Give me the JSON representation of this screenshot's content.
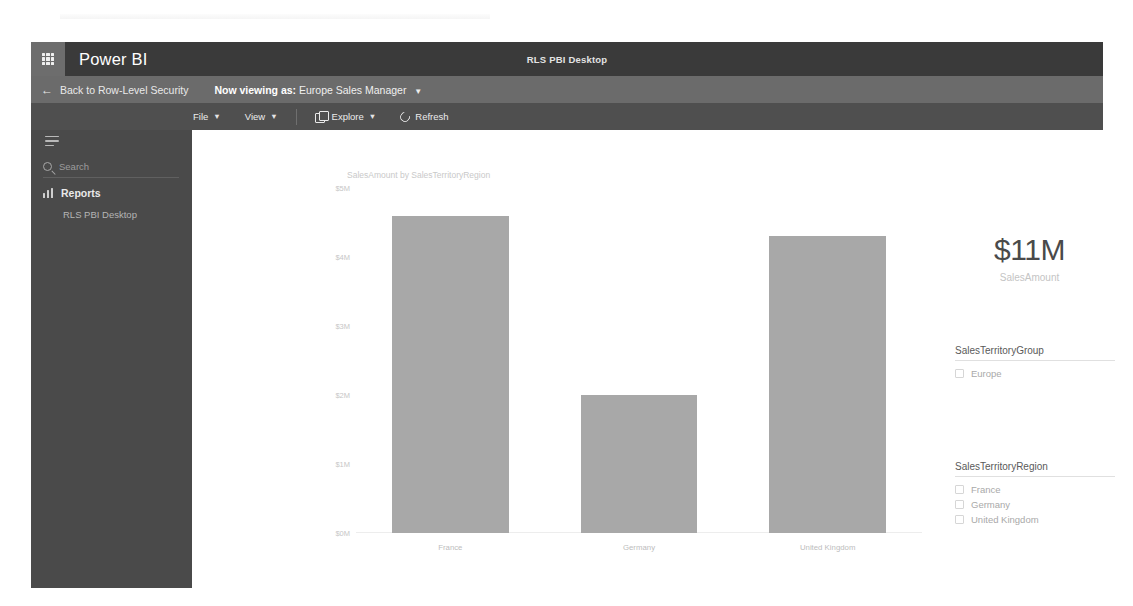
{
  "window": {
    "document_title": "RLS PBI Desktop"
  },
  "brand_bar": {
    "waffle_icon": "waffle-grid-icon",
    "product_name": "Power BI"
  },
  "rls_banner": {
    "back_arrow_icon": "arrow-left-icon",
    "back_label": "Back to Row-Level Security",
    "viewing_prefix": "Now viewing as:",
    "viewing_role": "Europe Sales Manager",
    "caret_icon": "chevron-down-icon"
  },
  "command_bar": {
    "items": [
      {
        "label": "File",
        "icon": "",
        "caret": "∨"
      },
      {
        "label": "View",
        "icon": "",
        "caret": "∨"
      },
      {
        "label": "Explore",
        "icon": "explore-icon",
        "caret": "∨"
      },
      {
        "label": "Refresh",
        "icon": "refresh-icon",
        "caret": ""
      }
    ]
  },
  "left_nav": {
    "collapse_icon": "hamburger-icon",
    "search": {
      "icon": "search-icon",
      "placeholder": "Search",
      "value": ""
    },
    "section": {
      "icon": "bar-chart-icon",
      "label": "Reports"
    },
    "report_items": [
      {
        "label": "RLS PBI Desktop"
      }
    ]
  },
  "kpi_card": {
    "value": "$11M",
    "label": "SalesAmount"
  },
  "slicers": [
    {
      "name": "sales-territory-group",
      "title": "SalesTerritoryGroup",
      "items": [
        {
          "label": "Europe",
          "checked": false
        }
      ]
    },
    {
      "name": "sales-territory-region",
      "title": "SalesTerritoryRegion",
      "items": [
        {
          "label": "France",
          "checked": false
        },
        {
          "label": "Germany",
          "checked": false
        },
        {
          "label": "United Kingdom",
          "checked": false
        }
      ]
    }
  ],
  "chart_data": {
    "type": "bar",
    "title": "SalesAmount by SalesTerritoryRegion",
    "categories": [
      "France",
      "Germany",
      "United Kingdom"
    ],
    "values": [
      4.6,
      2.0,
      4.3
    ],
    "value_unit": "M",
    "xlabel": "",
    "ylabel": "",
    "ylim": [
      0,
      5
    ],
    "ytick_labels": [
      "$5M",
      "$4M",
      "$3M",
      "$2M",
      "$1M",
      "$0M"
    ],
    "ytick_values": [
      5,
      4,
      3,
      2,
      1,
      0
    ],
    "grid": false,
    "legend": "none",
    "bar_color": "#a8a8a8"
  },
  "colors": {
    "brand_bar": "#3a3a3a",
    "rls_banner": "#6b6b6b",
    "command_bar": "#4f4f4f",
    "left_nav": "#4a4a4a",
    "canvas": "#ffffff",
    "bar_fill": "#a8a8a8",
    "kpi_text": "#4a4a4a"
  }
}
